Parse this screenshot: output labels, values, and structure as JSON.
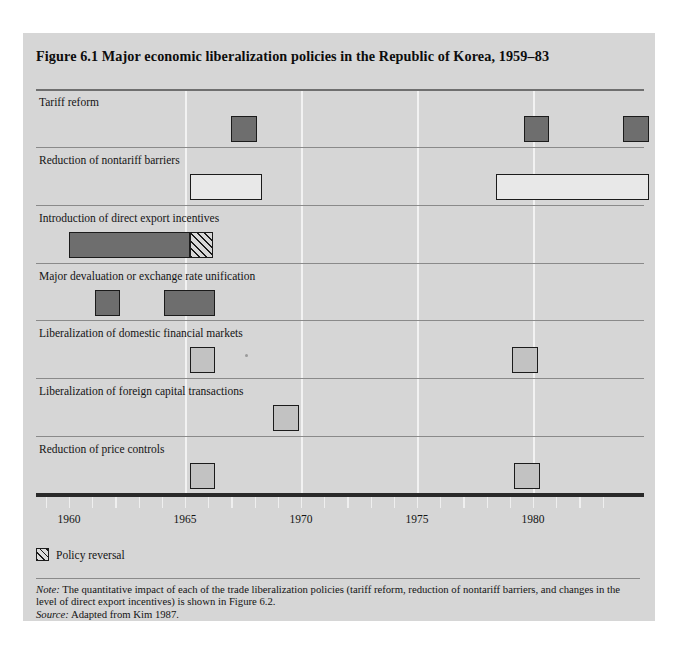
{
  "figure": {
    "title": "Figure 6.1  Major economic liberalization policies in the Republic of Korea, 1959–83"
  },
  "legend": {
    "swatch_name": "hatched-pattern-swatch",
    "label": "Policy reversal"
  },
  "notes": {
    "note_prefix": "Note:",
    "note_text": " The quantitative impact of each of the trade liberalization policies (tariff reform, reduction of nontariff barriers, and changes in the level of direct export incentives) is shown in Figure 6.2.",
    "source_prefix": "Source:",
    "source_text": " Adapted from Kim 1987."
  },
  "colors": {
    "panel_background": "#d6d6d6",
    "bar_dark": "#6e6e6e",
    "bar_light": "#c2c2c2",
    "bar_open": "#e8e8e8",
    "outline": "#1b1b1b",
    "gridline": "#f2f2f2",
    "rowline": "#8a8a8a",
    "axis": "#2a2a2a"
  },
  "chart_data": {
    "type": "bar",
    "title": "Figure 6.1  Major economic liberalization policies in the Republic of Korea, 1959–83",
    "xlabel": "",
    "ylabel": "",
    "orientation": "horizontal",
    "xlim": [
      1959,
      1983.8
    ],
    "grid": true,
    "legend_position": "below-axis-left",
    "xticks_major": [
      1960,
      1965,
      1970,
      1975,
      1980
    ],
    "xticks_minor_step": 1,
    "gridlines_at": [
      1965,
      1970,
      1975,
      1980
    ],
    "categories": [
      "Tariff reform",
      "Reduction of nontariff barriers",
      "Introduction of direct export incentives",
      "Major devaluation or exchange rate unification",
      "Liberalization of domestic financial markets",
      "Liberalization of foreign capital transactions",
      "Reduction of price controls"
    ],
    "series": [
      {
        "name": "Tariff reform",
        "style": "dark",
        "intervals": [
          {
            "start": 1967.0,
            "end": 1968.1
          },
          {
            "start": 1979.6,
            "end": 1980.7
          },
          {
            "start": 1983.9,
            "end": 1985.0
          }
        ]
      },
      {
        "name": "Reduction of nontariff barriers",
        "style": "open",
        "intervals": [
          {
            "start": 1965.2,
            "end": 1968.3
          },
          {
            "start": 1978.4,
            "end": 1985.0
          }
        ]
      },
      {
        "name": "Introduction of direct export incentives",
        "style": "dark",
        "intervals": [
          {
            "start": 1960.0,
            "end": 1965.2
          }
        ],
        "reversal_intervals": [
          {
            "start": 1965.2,
            "end": 1966.2
          }
        ]
      },
      {
        "name": "Major devaluation or exchange rate unification",
        "style": "dark",
        "intervals": [
          {
            "start": 1961.1,
            "end": 1962.2
          },
          {
            "start": 1964.1,
            "end": 1966.3
          }
        ]
      },
      {
        "name": "Liberalization of domestic financial markets",
        "style": "light",
        "intervals": [
          {
            "start": 1965.2,
            "end": 1966.3
          },
          {
            "start": 1979.1,
            "end": 1980.2
          }
        ]
      },
      {
        "name": "Liberalization of foreign capital transactions",
        "style": "light",
        "intervals": [
          {
            "start": 1968.8,
            "end": 1969.9
          }
        ]
      },
      {
        "name": "Reduction of price controls",
        "style": "light",
        "intervals": [
          {
            "start": 1965.2,
            "end": 1966.3
          },
          {
            "start": 1979.2,
            "end": 1980.3
          }
        ]
      }
    ]
  }
}
